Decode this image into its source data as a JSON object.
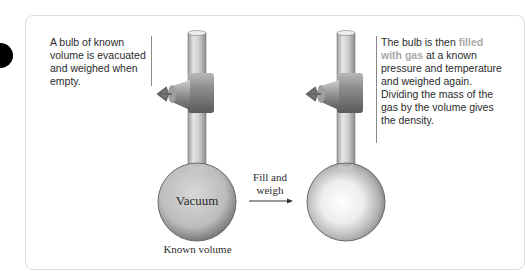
{
  "figure": {
    "left_caption": "A bulb of known volume is evacuated and weighed when empty.",
    "right_caption": {
      "before": "The bulb is then ",
      "highlight": "filled with gas",
      "after": " at a known pressure and temperature and weighed again. Dividing the mass of the gas by the volume gives the density."
    },
    "bulb_left_label": "Vacuum",
    "bulb_left_sublabel": "Known volume",
    "arrow_label_line1": "Fill and",
    "arrow_label_line2": "weigh",
    "colors": {
      "highlight_text": "#a8a8a8",
      "body_text": "#2b2b2b",
      "panel_border": "#dcdcdc"
    }
  }
}
